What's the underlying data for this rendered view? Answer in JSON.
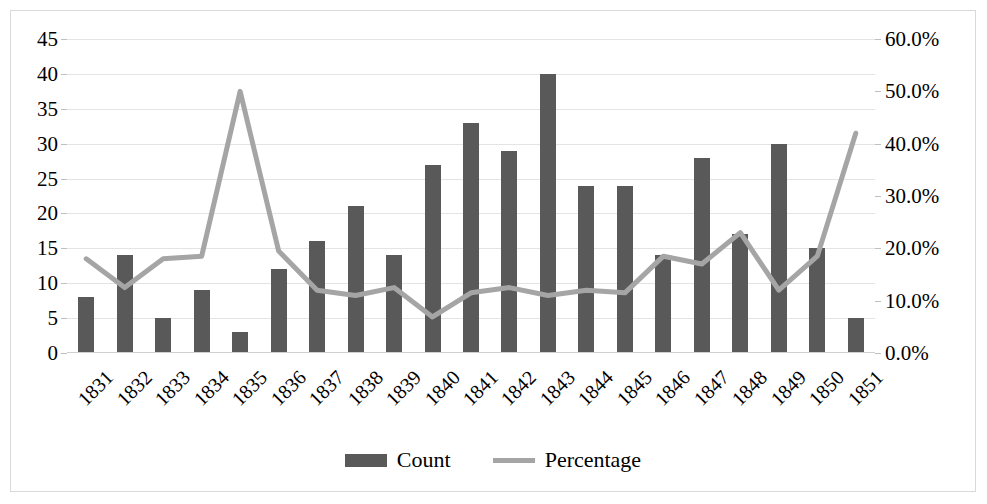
{
  "chart_data": {
    "type": "bar",
    "title": "",
    "xlabel": "",
    "ylabel": "",
    "categories": [
      "1831",
      "1832",
      "1833",
      "1834",
      "1835",
      "1836",
      "1837",
      "1838",
      "1839",
      "1840",
      "1841",
      "1842",
      "1843",
      "1844",
      "1845",
      "1846",
      "1847",
      "1848",
      "1849",
      "1850",
      "1851"
    ],
    "series": [
      {
        "name": "Count",
        "type": "bar",
        "axis": "left",
        "color": "#595959",
        "values": [
          8,
          14,
          5,
          9,
          3,
          12,
          16,
          21,
          14,
          27,
          33,
          29,
          40,
          24,
          24,
          14,
          28,
          17,
          30,
          15,
          5
        ]
      },
      {
        "name": "Percentage",
        "type": "line",
        "axis": "right",
        "color": "#a5a5a5",
        "values": [
          18.0,
          12.5,
          18.0,
          18.5,
          50.0,
          19.5,
          12.0,
          11.0,
          12.5,
          6.9,
          11.5,
          12.5,
          11.0,
          12.0,
          11.5,
          18.5,
          17.0,
          23.0,
          12.0,
          18.5,
          42.0
        ]
      }
    ],
    "left_axis": {
      "min": 0,
      "max": 45,
      "step": 5,
      "ticks": [
        "0",
        "5",
        "10",
        "15",
        "20",
        "25",
        "30",
        "35",
        "40",
        "45"
      ]
    },
    "right_axis": {
      "min": 0,
      "max": 60,
      "step": 10,
      "ticks": [
        "0.0%",
        "10.0%",
        "20.0%",
        "30.0%",
        "40.0%",
        "50.0%",
        "60.0%"
      ]
    },
    "grid": true,
    "legend_position": "bottom",
    "legend": [
      {
        "label": "Count",
        "marker": "bar",
        "color": "#595959"
      },
      {
        "label": "Percentage",
        "marker": "line",
        "color": "#a5a5a5"
      }
    ]
  }
}
